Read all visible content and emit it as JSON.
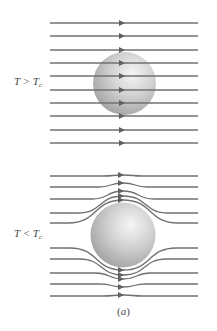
{
  "figure": {
    "caption": "a",
    "colors": {
      "field_line": "#707070",
      "arrow": "#606060",
      "sphere_highlight": "#f4f4f4",
      "sphere_mid": "#cfcfcf",
      "sphere_edge": "#9a9a9a",
      "label_text": "#4a4a4a"
    },
    "panels": [
      {
        "id": "normal",
        "label_var": "T",
        "label_relation": ">",
        "label_sub_var": "T",
        "label_sub": "c",
        "description": "Magnetic field lines pass straight through the sphere (normal state)",
        "sphere": {
          "cx": 124.5,
          "cy": 83.5,
          "r": 31.5
        },
        "field_line_y": [
          23,
          36,
          50,
          63,
          76,
          90,
          103,
          116,
          130,
          143
        ],
        "line_x_range": [
          50,
          198
        ],
        "arrow_x": 122
      },
      {
        "id": "superconducting",
        "label_var": "T",
        "label_relation": "<",
        "label_sub_var": "T",
        "label_sub": "c",
        "description": "Magnetic field lines expelled and bend around the sphere (Meissner effect)",
        "sphere": {
          "cx": 123,
          "cy": 235,
          "r": 32.5
        },
        "field_lines": [
          {
            "y_far": 176,
            "y_center": 175
          },
          {
            "y_far": 187,
            "y_center": 183
          },
          {
            "y_far": 199,
            "y_center": 191
          },
          {
            "y_far": 213,
            "y_center": 196
          },
          {
            "y_far": 223,
            "y_center": 200
          },
          {
            "y_far": 248,
            "y_center": 270
          },
          {
            "y_far": 259,
            "y_center": 275
          },
          {
            "y_far": 273,
            "y_center": 279
          },
          {
            "y_far": 284,
            "y_center": 287
          },
          {
            "y_far": 296,
            "y_center": 295
          }
        ],
        "line_x_range": [
          50,
          198
        ],
        "arrow_x": 121
      }
    ]
  }
}
